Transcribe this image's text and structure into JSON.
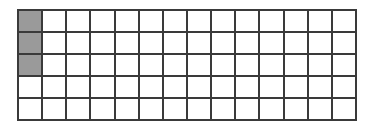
{
  "figure": {
    "name": "fraction-bar-grid",
    "background_color": "#ffffff"
  },
  "grid": {
    "columns": 14,
    "rows": 5,
    "total_cells": 70,
    "shaded_count": 3,
    "unshaded_count": 67,
    "line_color": "#3a3a3a",
    "line_width_px": 2,
    "cell_fill_color": "#ffffff",
    "shaded_fill_color": "#9a9a9a",
    "shaded_cells": [
      {
        "row": 1,
        "column": 1
      },
      {
        "row": 2,
        "column": 1
      },
      {
        "row": 3,
        "column": 1
      }
    ],
    "cells": [
      [
        "shaded",
        "empty",
        "empty",
        "empty",
        "empty",
        "empty",
        "empty",
        "empty",
        "empty",
        "empty",
        "empty",
        "empty",
        "empty",
        "empty"
      ],
      [
        "shaded",
        "empty",
        "empty",
        "empty",
        "empty",
        "empty",
        "empty",
        "empty",
        "empty",
        "empty",
        "empty",
        "empty",
        "empty",
        "empty"
      ],
      [
        "shaded",
        "empty",
        "empty",
        "empty",
        "empty",
        "empty",
        "empty",
        "empty",
        "empty",
        "empty",
        "empty",
        "empty",
        "empty",
        "empty"
      ],
      [
        "empty",
        "empty",
        "empty",
        "empty",
        "empty",
        "empty",
        "empty",
        "empty",
        "empty",
        "empty",
        "empty",
        "empty",
        "empty",
        "empty"
      ],
      [
        "empty",
        "empty",
        "empty",
        "empty",
        "empty",
        "empty",
        "empty",
        "empty",
        "empty",
        "empty",
        "empty",
        "empty",
        "empty",
        "empty"
      ]
    ]
  }
}
